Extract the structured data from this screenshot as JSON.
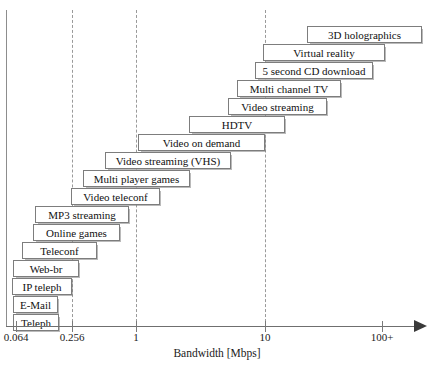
{
  "chart_data": {
    "type": "bar",
    "title": "",
    "xlabel": "Bandwidth [Mbps]",
    "ylabel": "",
    "orientation": "horizontal",
    "scale": "log",
    "grid": "vertical dashed at 0.256, 1, 10",
    "legend": "none",
    "axis_ticks": [
      {
        "label": "0.064",
        "x": 16
      },
      {
        "label": "0.256",
        "x": 72
      },
      {
        "label": "1",
        "x": 136
      },
      {
        "label": "10",
        "x": 265
      },
      {
        "label": "100+",
        "x": 382
      }
    ],
    "gridlines": [
      72,
      136,
      265
    ],
    "categories": [
      "3D holographics",
      "Virtual reality",
      "5 second CD download",
      "Multi channel TV",
      "Video streaming",
      "HDTV",
      "Video on demand",
      "Video streaming (VHS)",
      "Multi player games",
      "Video teleconf",
      "MP3 streaming",
      "Online games",
      "Teleconf",
      "Web-br",
      "IP teleph",
      "E-Mail",
      "Teleph"
    ],
    "bars": [
      {
        "label": "3D holographics",
        "x": 307,
        "width": 115,
        "y": 26,
        "start_mbps": 25,
        "end_mbps": 120
      },
      {
        "label": "Virtual reality",
        "x": 263,
        "width": 122,
        "y": 44,
        "start_mbps": 9.5,
        "end_mbps": 70
      },
      {
        "label": "5 second CD download",
        "x": 255,
        "width": 118,
        "y": 62,
        "start_mbps": 8.0,
        "end_mbps": 52
      },
      {
        "label": "Multi channel TV",
        "x": 237,
        "width": 104,
        "y": 80,
        "start_mbps": 5.3,
        "end_mbps": 25
      },
      {
        "label": "Video streaming",
        "x": 228,
        "width": 99,
        "y": 98,
        "start_mbps": 4.3,
        "end_mbps": 19
      },
      {
        "label": "HDTV",
        "x": 189,
        "width": 96,
        "y": 116,
        "start_mbps": 2.1,
        "end_mbps": 10
      },
      {
        "label": "Video on demand",
        "x": 138,
        "width": 127,
        "y": 134,
        "start_mbps": 1.02,
        "end_mbps": 10
      },
      {
        "label": "Video streaming (VHS)",
        "x": 105,
        "width": 126,
        "y": 152,
        "start_mbps": 0.55,
        "end_mbps": 5.3
      },
      {
        "label": "Multi player games",
        "x": 83,
        "width": 107,
        "y": 170,
        "start_mbps": 0.36,
        "end_mbps": 2.1
      },
      {
        "label": "Video teleconf",
        "x": 71,
        "width": 89,
        "y": 188,
        "start_mbps": 0.256,
        "end_mbps": 1.4
      },
      {
        "label": "MP3 streaming",
        "x": 35,
        "width": 94,
        "y": 206,
        "start_mbps": 0.098,
        "end_mbps": 0.84
      },
      {
        "label": "Online games",
        "x": 33,
        "width": 87,
        "y": 224,
        "start_mbps": 0.095,
        "end_mbps": 0.62
      },
      {
        "label": "Teleconf",
        "x": 22,
        "width": 75,
        "y": 242,
        "start_mbps": 0.077,
        "end_mbps": 0.4
      },
      {
        "label": "Web-br",
        "x": 13,
        "width": 66,
        "y": 260,
        "start_mbps": 0.064,
        "end_mbps": 0.28
      },
      {
        "label": "IP teleph",
        "x": 12,
        "width": 60,
        "y": 278,
        "start_mbps": 0.064,
        "end_mbps": 0.256
      },
      {
        "label": "E-Mail",
        "x": 13,
        "width": 45,
        "y": 296,
        "start_mbps": 0.064,
        "end_mbps": 0.17
      },
      {
        "label": "Teleph",
        "x": 13,
        "width": 46,
        "y": 314,
        "start_mbps": 0.064,
        "end_mbps": 0.175
      }
    ]
  }
}
